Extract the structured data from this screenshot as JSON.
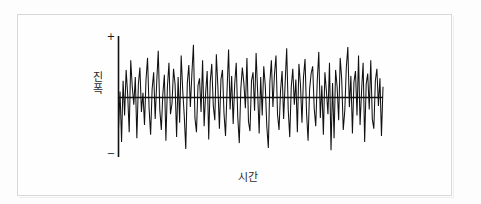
{
  "figure": {
    "kind": "noise-waveform-diagram",
    "background_color": "#fdfdfd",
    "frame_color": "#d8d8d8",
    "ink_color": "#111111"
  },
  "axes": {
    "y_label_chars": [
      "진",
      "폭"
    ],
    "y_label_text": "진폭",
    "x_label_text": "시간",
    "tick_positive": "+",
    "tick_negative": "−"
  },
  "chart_data": {
    "type": "line",
    "title": "",
    "subtitle": "",
    "xlabel": "시간",
    "ylabel": "진폭",
    "legend": [],
    "legend_position": "none",
    "grid": false,
    "annotations": [
      "+",
      "−"
    ],
    "xlim": [
      0,
      174
    ],
    "ylim": [
      -1,
      1
    ],
    "ytick_labels": [
      "+",
      "−"
    ],
    "xtick_labels": [],
    "zero_line": 0,
    "series": [
      {
        "name": "noise",
        "color": "#111111",
        "values": [
          -0.52,
          0.1,
          -0.74,
          0.28,
          -0.3,
          0.46,
          0.05,
          -0.58,
          0.62,
          0.18,
          -0.12,
          0.34,
          -0.68,
          0.22,
          0.5,
          -0.24,
          0.08,
          -0.46,
          0.3,
          0.66,
          -0.18,
          -0.62,
          0.14,
          0.42,
          -0.36,
          0.26,
          0.78,
          -0.2,
          -0.54,
          0.06,
          0.38,
          -0.72,
          0.18,
          0.58,
          -0.28,
          -0.1,
          0.48,
          0.22,
          -0.66,
          0.34,
          -0.42,
          0.7,
          0.12,
          -0.3,
          -0.86,
          0.24,
          0.54,
          -0.16,
          0.4,
          0.88,
          -0.34,
          -0.58,
          0.2,
          0.32,
          -0.24,
          0.62,
          -0.48,
          0.08,
          0.44,
          -0.7,
          0.26,
          0.56,
          -0.14,
          -0.38,
          0.72,
          0.18,
          -0.52,
          0.3,
          0.46,
          -0.26,
          -0.64,
          0.12,
          0.8,
          -0.2,
          0.36,
          -0.44,
          0.22,
          0.58,
          -0.32,
          -0.76,
          0.14,
          0.5,
          0.24,
          -0.18,
          0.66,
          -0.4,
          -0.56,
          0.28,
          0.42,
          -0.22,
          0.74,
          0.1,
          -0.6,
          0.34,
          -0.3,
          0.52,
          0.2,
          -0.48,
          -0.84,
          0.26,
          0.62,
          -0.16,
          0.38,
          0.7,
          -0.28,
          -0.54,
          0.12,
          0.44,
          -0.36,
          0.24,
          0.82,
          -0.2,
          -0.66,
          0.18,
          0.48,
          -0.12,
          0.3,
          -0.58,
          0.56,
          0.22,
          -0.42,
          0.34,
          0.64,
          -0.26,
          -0.72,
          0.14,
          0.4,
          0.52,
          -0.18,
          -0.48,
          0.28,
          0.76,
          -0.34,
          0.2,
          -0.62,
          0.42,
          0.1,
          -0.28,
          0.58,
          -0.88,
          0.24,
          -0.68,
          0.46,
          0.18,
          -0.38,
          0.66,
          0.3,
          -0.54,
          -0.22,
          0.5,
          0.84,
          -0.16,
          0.36,
          -0.6,
          0.26,
          0.44,
          -0.3,
          0.7,
          -0.46,
          0.12,
          0.58,
          -0.74,
          0.22,
          0.4,
          -0.2,
          0.62,
          -0.36,
          -0.52,
          0.28,
          0.48,
          -0.14,
          0.32,
          -0.64,
          0.18
        ]
      }
    ]
  }
}
